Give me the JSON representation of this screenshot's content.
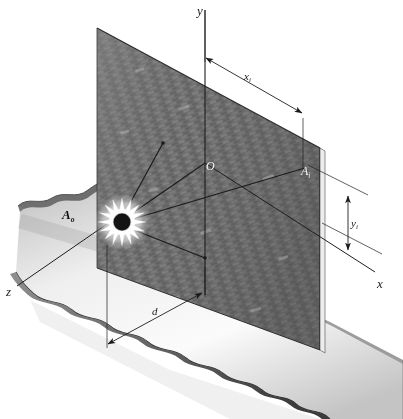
{
  "figure": {
    "type": "technical-optics-diagram",
    "background_color": "#ffffff"
  },
  "axes": {
    "y": {
      "label": "y",
      "description": "vertical axis pointing up"
    },
    "x": {
      "label": "x",
      "description": "axis receding to lower right along wall base"
    },
    "z": {
      "label": "z",
      "description": "axis receding to lower left toward viewer"
    }
  },
  "points": [
    {
      "name": "origin",
      "label": "O",
      "subscript": "",
      "color": "#f2f2f2",
      "note": "origin on wall"
    },
    {
      "name": "image-point",
      "label": "A",
      "subscript": "i",
      "color": "#f2f2f2",
      "note": "illuminated point on wall"
    },
    {
      "name": "source-point",
      "label": "A",
      "subscript": "o",
      "color": "#0d0d0d",
      "note": "point source on ground"
    }
  ],
  "dimensions": [
    {
      "name": "x-distance",
      "label": "x",
      "subscript": "i",
      "orientation": "diagonal-top",
      "arrows": "both"
    },
    {
      "name": "y-distance",
      "label": "y",
      "subscript": "i",
      "orientation": "vertical-right",
      "arrows": "both"
    },
    {
      "name": "d-distance",
      "label": "d",
      "subscript": "",
      "orientation": "diagonal-bottom",
      "arrows": "both"
    }
  ],
  "objects": {
    "wall": {
      "name": "brick-wall",
      "texture": "brick",
      "fill_color": "#6e6e6e",
      "edge_color": "#2a2a2a"
    },
    "ground": {
      "name": "ground-slab",
      "fill_color": "#b8b8b8",
      "edge_color": "#1f1f1f",
      "edge_style": "wavy-torn"
    },
    "source": {
      "name": "light-source-burst",
      "core_color": "#161616",
      "glow_color": "#ffffff",
      "rays": 4
    }
  },
  "colors": {
    "ink": "#1a1a1a",
    "wall": "#6e6e6e",
    "ground_light": "#f0f0f0",
    "ground_dark": "#9a9a9a",
    "white_label": "#f2f2f2"
  }
}
